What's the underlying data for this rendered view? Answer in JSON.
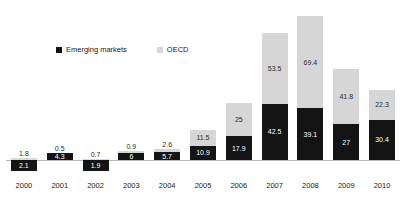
{
  "chart_data": {
    "type": "bar",
    "subtype": "stacked-bar",
    "title": "",
    "subtitle": "",
    "xlabel": "",
    "ylabel": "",
    "grid": false,
    "legend_position": "top-left",
    "axis_zero_line": true,
    "ylim": [
      -5,
      115
    ],
    "categories": [
      "2000",
      "2001",
      "2002",
      "2003",
      "2004",
      "2005",
      "2006",
      "2007",
      "2008",
      "2009",
      "2010"
    ],
    "series": [
      {
        "name": "Emerging markets",
        "color": "#141414",
        "values": [
          2.1,
          4.3,
          1.9,
          6,
          5.7,
          10.9,
          17.9,
          42.5,
          39.1,
          27,
          30.4
        ],
        "value_labels": [
          "2.1",
          "4.3",
          "1.9",
          "6",
          "5.7",
          "10.9",
          "17.9",
          "42.5",
          "39.1",
          "27",
          "30.4"
        ],
        "rendered_below_axis": [
          true,
          false,
          true,
          false,
          false,
          false,
          false,
          false,
          false,
          false,
          false
        ]
      },
      {
        "name": "OECD",
        "color": "#d6d6d6",
        "values": [
          1.8,
          0.5,
          0.7,
          0.9,
          2.6,
          11.5,
          25,
          53.5,
          69.4,
          41.8,
          22.3
        ],
        "value_labels": [
          "1.8",
          "0.5",
          "0.7",
          "0.9",
          "2.6",
          "11.5",
          "25",
          "53.5",
          "69.4",
          "41.8",
          "22.3"
        ]
      }
    ]
  },
  "legend": {
    "entries": [
      {
        "label": "Emerging markets",
        "swatch": "black-square-icon"
      },
      {
        "label": "OECD",
        "swatch": "gray-square-icon"
      }
    ]
  }
}
